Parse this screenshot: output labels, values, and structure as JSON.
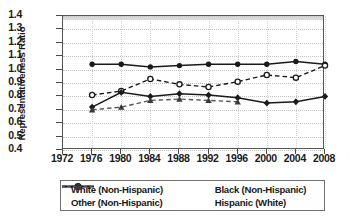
{
  "axes": {
    "ylabel": "Representativeness Ratio",
    "yticks": [
      "0.4",
      "0.5",
      "0.6",
      "0.7",
      "0.8",
      "0.9",
      "1.0",
      "1.1",
      "1.2",
      "1.3",
      "1.4"
    ],
    "xticks": [
      "1972",
      "1976",
      "1980",
      "1984",
      "1988",
      "1992",
      "1996",
      "2000",
      "2004",
      "2008"
    ]
  },
  "legend": {
    "items": [
      {
        "label": "White (Non-Hispanic)",
        "style": "solid-filled-circle"
      },
      {
        "label": "Black (Non-Hispanic)",
        "style": "dashed-open-circle"
      },
      {
        "label": "Other (Non-Hispanic)",
        "style": "solid-filled-diamond"
      },
      {
        "label": "Hispanic (White)",
        "style": "dashed-filled-triangle"
      }
    ]
  },
  "chart_data": {
    "type": "line",
    "title": "",
    "xlabel": "",
    "ylabel": "Representativeness Ratio",
    "xlim": [
      1972,
      2008
    ],
    "ylim": [
      0.4,
      1.4
    ],
    "grid": true,
    "legend_position": "bottom",
    "x": [
      1976,
      1980,
      1984,
      1988,
      1992,
      1996,
      2000,
      2004,
      2008
    ],
    "series": [
      {
        "name": "White (Non-Hispanic)",
        "marker": "filled-circle",
        "line": "solid",
        "color": "#1a1a1a",
        "x": [
          1976,
          1980,
          1984,
          1988,
          1992,
          1996,
          2000,
          2004,
          2008
        ],
        "values": [
          1.04,
          1.04,
          1.02,
          1.03,
          1.04,
          1.04,
          1.04,
          1.06,
          1.04
        ]
      },
      {
        "name": "Black (Non-Hispanic)",
        "marker": "open-circle",
        "line": "dashed",
        "color": "#1a1a1a",
        "x": [
          1976,
          1980,
          1984,
          1988,
          1992,
          1996,
          2000,
          2004,
          2008
        ],
        "values": [
          0.81,
          0.84,
          0.93,
          0.89,
          0.87,
          0.91,
          0.96,
          0.94,
          1.03
        ]
      },
      {
        "name": "Other (Non-Hispanic)",
        "marker": "filled-diamond",
        "line": "solid",
        "color": "#1a1a1a",
        "x": [
          1976,
          1980,
          1984,
          1988,
          1992,
          1996,
          2000,
          2004,
          2008
        ],
        "values": [
          0.72,
          0.83,
          0.8,
          0.82,
          0.81,
          0.79,
          0.75,
          0.76,
          0.8
        ]
      },
      {
        "name": "Hispanic (White)",
        "marker": "filled-triangle",
        "line": "dashed",
        "color": "#555555",
        "x": [
          1976,
          1980,
          1984,
          1988,
          1992,
          1996
        ],
        "values": [
          0.7,
          0.72,
          0.77,
          0.78,
          0.77,
          0.76
        ]
      }
    ]
  }
}
